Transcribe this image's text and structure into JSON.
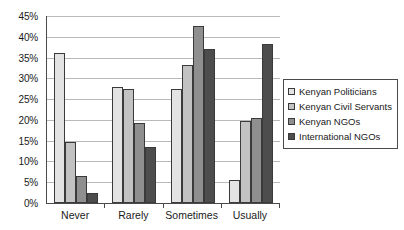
{
  "chart_data": {
    "type": "bar",
    "title": "",
    "subtitle": "",
    "xlabel": "",
    "ylabel": "",
    "categories": [
      "Never",
      "Rarely",
      "Sometimes",
      "Usually"
    ],
    "series": [
      {
        "name": "Kenyan Politicians",
        "color": "#e3e3e3",
        "values": [
          36.0,
          28.0,
          27.5,
          5.6
        ]
      },
      {
        "name": "Kenyan Civil Servants",
        "color": "#c2c2c2",
        "values": [
          14.6,
          27.4,
          33.2,
          19.8
        ]
      },
      {
        "name": "Kenyan NGOs",
        "color": "#8f8f8f",
        "values": [
          6.6,
          19.2,
          42.5,
          20.4
        ]
      },
      {
        "name": "International NGOs",
        "color": "#4d4d4d",
        "values": [
          2.4,
          13.5,
          37.0,
          38.3
        ]
      }
    ],
    "ylim": [
      0,
      45
    ],
    "ytick_step": 5,
    "ytick_labels": [
      "0%",
      "5%",
      "10%",
      "15%",
      "20%",
      "25%",
      "30%",
      "35%",
      "40%",
      "45%"
    ],
    "ytick_values": [
      0,
      5,
      10,
      15,
      20,
      25,
      30,
      35,
      40,
      45
    ],
    "value_suffix": "%",
    "grid": true,
    "grid_axis": "y",
    "grid_color": "#b9b9b9",
    "axis_color": "#4a4a4a",
    "legend": true,
    "legend_position": "right",
    "legend_border_color": "#4a4a4a",
    "background": "#ffffff"
  }
}
